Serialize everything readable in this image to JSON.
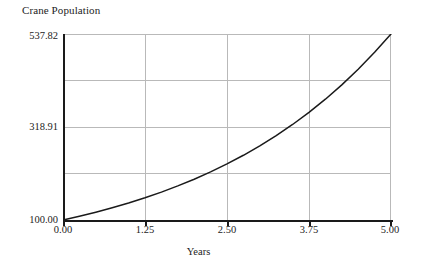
{
  "chart_data": {
    "type": "line",
    "title": "Crane Population",
    "xlabel": "Years",
    "ylabel": "",
    "xlim": [
      0.0,
      5.0
    ],
    "ylim": [
      100.0,
      537.82
    ],
    "grid": true,
    "legend": false,
    "x_ticks": [
      "0.00",
      "1.25",
      "2.50",
      "3.75",
      "5.00"
    ],
    "x_tick_values": [
      0.0,
      1.25,
      2.5,
      3.75,
      5.0
    ],
    "y_ticks": [
      "100.00",
      "",
      "318.91",
      "",
      "537.82"
    ],
    "y_tick_values": [
      100.0,
      209.46,
      318.91,
      428.36,
      537.82
    ],
    "series": [
      {
        "name": "Crane Population",
        "color": "#1a1a1a",
        "x": [
          0.0,
          0.25,
          0.5,
          0.75,
          1.0,
          1.25,
          1.5,
          1.75,
          2.0,
          2.25,
          2.5,
          2.75,
          3.0,
          3.25,
          3.5,
          3.75,
          4.0,
          4.25,
          4.5,
          4.75,
          5.0
        ],
        "values": [
          100.0,
          108.8,
          118.35,
          128.73,
          140.03,
          152.32,
          165.69,
          180.23,
          196.05,
          213.26,
          231.98,
          252.35,
          274.5,
          298.59,
          324.81,
          353.32,
          384.34,
          418.08,
          454.78,
          494.71,
          537.82
        ]
      }
    ]
  },
  "chart": {
    "title": "Crane Population",
    "x_axis_title": "Years",
    "y_tick_labels": [
      {
        "text": "537.82"
      },
      {
        "text": ""
      },
      {
        "text": "318.91"
      },
      {
        "text": ""
      },
      {
        "text": "100.00"
      }
    ],
    "x_tick_labels": [
      {
        "text": "0.00"
      },
      {
        "text": "1.25"
      },
      {
        "text": "2.50"
      },
      {
        "text": "3.75"
      },
      {
        "text": "5.00"
      }
    ],
    "colors": {
      "curve": "#1a1a1a",
      "axis": "#1a1a1a",
      "grid": "#b9b9b9",
      "background": "#ffffff",
      "text": "#232323"
    }
  }
}
